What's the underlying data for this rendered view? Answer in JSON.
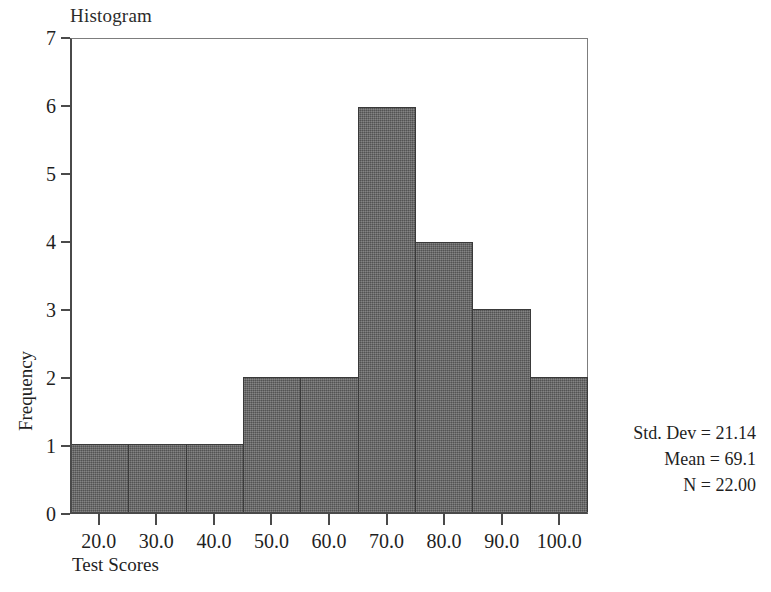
{
  "chart_data": {
    "type": "bar",
    "title": "Histogram",
    "xlabel": "Test Scores",
    "ylabel": "Frequency",
    "categories": [
      "20.0",
      "30.0",
      "40.0",
      "50.0",
      "60.0",
      "70.0",
      "80.0",
      "90.0",
      "100.0"
    ],
    "values": [
      1,
      1,
      1,
      2,
      2,
      6,
      4,
      3,
      2
    ],
    "bin_centers": [
      20.0,
      30.0,
      40.0,
      50.0,
      60.0,
      70.0,
      80.0,
      90.0,
      100.0
    ],
    "bin_width": 10,
    "xlim": [
      15,
      105
    ],
    "ylim": [
      0,
      7
    ],
    "y_ticks": [
      0,
      1,
      2,
      3,
      4,
      5,
      6,
      7
    ],
    "y_tick_labels": [
      "0",
      "1",
      "2",
      "3",
      "4",
      "5",
      "6",
      "7"
    ],
    "x_tick_labels": [
      "20.0",
      "30.0",
      "40.0",
      "50.0",
      "60.0",
      "70.0",
      "80.0",
      "90.0",
      "100.0"
    ],
    "grid": false,
    "legend": null,
    "bar_color": "#666666",
    "bar_edge_color": "#3a3a3a",
    "annotations": [
      "Std. Dev = 21.14",
      "Mean = 69.1",
      "N = 22.00"
    ]
  },
  "stats": {
    "std_dev_label": "Std. Dev = 21.14",
    "mean_label": "Mean = 69.1",
    "n_label": "N = 22.00"
  }
}
